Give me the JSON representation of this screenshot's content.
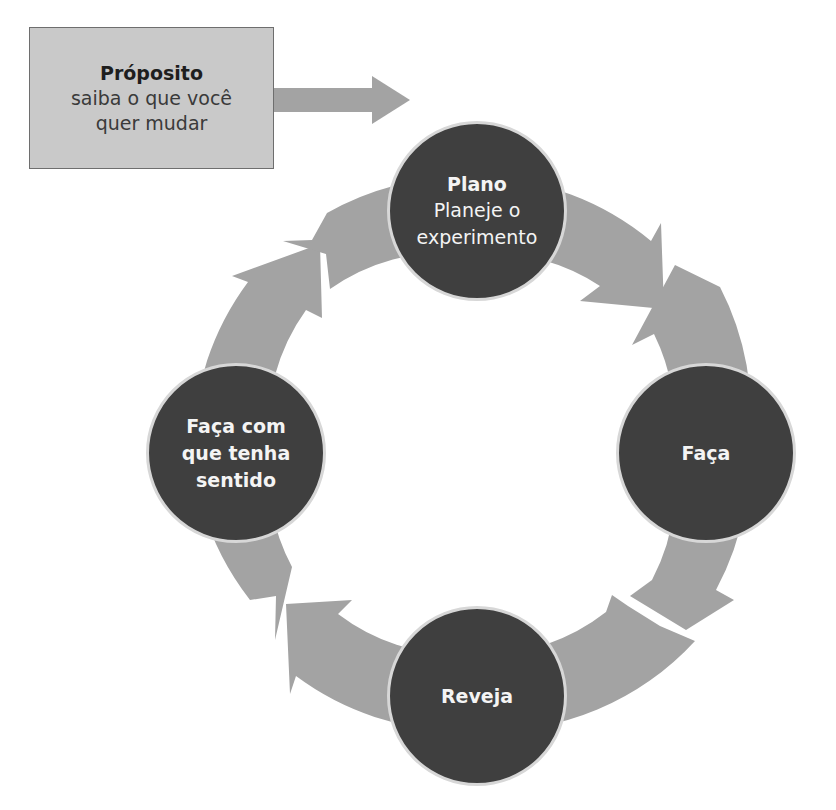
{
  "colors": {
    "arrow": "#a3a3a3",
    "node_fill": "#3f3f3f",
    "node_border": "#d7d7d7",
    "node_text": "#f4f4f4",
    "box_fill": "#c9c9c9",
    "box_border": "#6e6e6e"
  },
  "purpose": {
    "title": "Próposito",
    "line1": "saiba o que você",
    "line2": "quer mudar"
  },
  "cycle": {
    "plan": {
      "title": "Plano",
      "line1": "Planeje o",
      "line2": "experimento"
    },
    "do": {
      "title": "Faça"
    },
    "review": {
      "title": "Reveja"
    },
    "sense": {
      "line1": "Faça com",
      "line2": "que tenha",
      "line3": "sentido"
    }
  }
}
